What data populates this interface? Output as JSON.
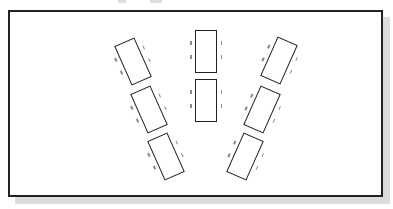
{
  "diagram": {
    "type": "classroom-seating-layout",
    "frame": {
      "border_color": "#222222",
      "shadow_color": "#dcdcdc",
      "background": "#ffffff"
    },
    "columns": [
      {
        "name": "left",
        "rotation_deg": -24,
        "desks": [
          {
            "cx": 133,
            "cy": 61
          },
          {
            "cx": 149,
            "cy": 109
          },
          {
            "cx": 166,
            "cy": 156
          }
        ]
      },
      {
        "name": "center",
        "rotation_deg": 0,
        "desks": [
          {
            "cx": 206,
            "cy": 51
          },
          {
            "cx": 206,
            "cy": 100
          }
        ]
      },
      {
        "name": "right",
        "rotation_deg": 24,
        "desks": [
          {
            "cx": 279,
            "cy": 60
          },
          {
            "cx": 262,
            "cy": 109
          },
          {
            "cx": 245,
            "cy": 156
          }
        ]
      }
    ],
    "chairs_per_side": 2,
    "desk_count": 8
  }
}
